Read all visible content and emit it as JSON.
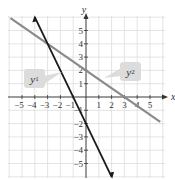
{
  "chart_data": {
    "type": "line",
    "title": "",
    "xlabel": "x",
    "ylabel": "y",
    "xlim": [
      -5.8,
      6
    ],
    "ylim": [
      -6,
      6
    ],
    "grid": true,
    "x_ticks": [
      -5,
      -4,
      -3,
      -2,
      -1,
      1,
      2,
      3,
      4,
      5
    ],
    "y_ticks": [
      -5,
      -4,
      -3,
      -2,
      -1,
      1,
      2,
      3,
      4,
      5
    ],
    "x_tick_labels": [
      "−5",
      "−4",
      "−3",
      "−2",
      "−1",
      "1",
      "2",
      "3",
      "4",
      "5"
    ],
    "y_tick_labels": [
      "−5",
      "−4",
      "−3",
      "−2",
      "−1",
      "1",
      "2",
      "3",
      "4",
      "5"
    ],
    "series": [
      {
        "name": "y1",
        "label": "y",
        "subscript": "1",
        "color": "#1a1a1a",
        "slope": -2,
        "intercept": -2,
        "points": [
          [
            -4,
            6
          ],
          [
            -3,
            4
          ],
          [
            -1,
            0
          ],
          [
            0,
            -2
          ],
          [
            2,
            -6
          ]
        ]
      },
      {
        "name": "y2",
        "label": "y",
        "subscript": "2",
        "color": "#8a8a8a",
        "slope": -0.6667,
        "intercept": 2,
        "points": [
          [
            -6,
            6
          ],
          [
            -3,
            4
          ],
          [
            0,
            2
          ],
          [
            3,
            0
          ],
          [
            6,
            -2
          ]
        ]
      }
    ],
    "intersection": [
      -3,
      4
    ]
  },
  "colors": {
    "grid": "#d8d8d8",
    "axis": "#333333",
    "label_bg": "#dcdcdc"
  }
}
